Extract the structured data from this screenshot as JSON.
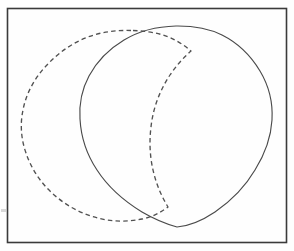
{
  "figure": {
    "background_color": "#fefefe",
    "stroke_color": "#4a4a4a",
    "frame_color": "#3a3a3a",
    "width": 294,
    "height": 251
  },
  "frame": {
    "label": "outer-border",
    "x": 7,
    "y": 8,
    "width": 280,
    "height": 235,
    "stroke_width": 1.6
  },
  "shapes": [
    {
      "name": "solid-circle",
      "style": "solid",
      "center_x": 176,
      "center_y": 126,
      "radius": 96,
      "bounds": {
        "left": 80,
        "right": 272,
        "top": 26,
        "bottom": 227
      },
      "stroke_color": "#4a4a4a",
      "stroke_width": 1.15
    },
    {
      "name": "dashed-circle",
      "style": "dashed",
      "center_x": 97,
      "center_y": 126,
      "radius": 96,
      "bounds": {
        "left": 22,
        "right": 173,
        "top": 30,
        "bottom": 222
      },
      "stroke_color": "#515151",
      "stroke_width": 1.35,
      "dash_length": 4.5,
      "dash_gap": 3.2
    }
  ],
  "intersections": [
    {
      "name": "upper-crossing",
      "x": 140,
      "y": 32
    },
    {
      "name": "lower-crossing",
      "x": 145,
      "y": 220
    }
  ],
  "artifact": {
    "name": "scan-speck",
    "x": 1,
    "y": 209,
    "width": 5,
    "height": 3
  }
}
